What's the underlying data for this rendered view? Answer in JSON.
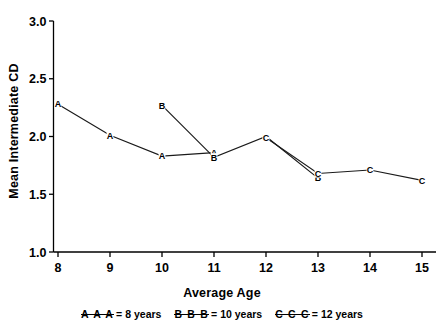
{
  "chart_data": {
    "type": "line",
    "title": "",
    "xlabel": "Average Age",
    "ylabel": "Mean Intermediate CD",
    "xlim": [
      7.6,
      15.4
    ],
    "ylim": [
      1.0,
      3.0
    ],
    "xticks": [
      8,
      9,
      10,
      11,
      12,
      13,
      14,
      15
    ],
    "xtick_labels": [
      "8",
      "9",
      "10",
      "11",
      "12",
      "13",
      "14",
      "15"
    ],
    "yticks": [
      1.0,
      1.5,
      2.0,
      2.5,
      3.0
    ],
    "ytick_labels": [
      "1.0",
      "1.5",
      "2.0",
      "2.5",
      "3.0"
    ],
    "grid": false,
    "legend_position": "below-axis",
    "marker_style": "letter",
    "series": [
      {
        "name": "A",
        "legend_label": "8 years",
        "marker": "A",
        "x": [
          8,
          9,
          10,
          11
        ],
        "values": [
          2.28,
          2.01,
          1.83,
          1.86
        ]
      },
      {
        "name": "B",
        "legend_label": "10 years",
        "marker": "B",
        "x": [
          10,
          11,
          12,
          13
        ],
        "values": [
          2.27,
          1.82,
          2.0,
          1.64
        ]
      },
      {
        "name": "C",
        "legend_label": "12 years",
        "marker": "C",
        "x": [
          12,
          13,
          14,
          15
        ],
        "values": [
          1.99,
          1.68,
          1.71,
          1.62
        ]
      }
    ]
  },
  "axes": {
    "x_title": "Average Age",
    "y_title": "Mean Intermediate CD"
  },
  "legend": {
    "items": [
      {
        "keys": "A A A",
        "eq": "=",
        "label": "8 years"
      },
      {
        "keys": "B B B",
        "eq": "=",
        "label": "10 years"
      },
      {
        "keys": "C C C",
        "eq": "=",
        "label": " 12 years"
      }
    ]
  },
  "colors": {
    "axis": "#000000",
    "line": "#1a1a1a",
    "text": "#000000",
    "background": "#ffffff"
  }
}
